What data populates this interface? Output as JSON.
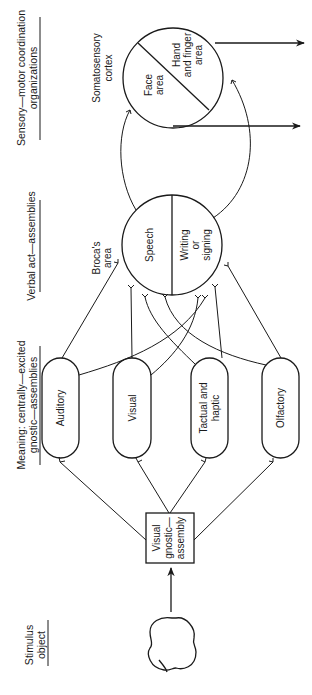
{
  "column_headers": {
    "stimulus": [
      "Stimulus",
      "object"
    ],
    "meaning": [
      "Meaning: centrally—excited",
      "gnostic—assemblies"
    ],
    "verbal": [
      "Verbal act—assemblies"
    ],
    "sensory_motor": [
      "Sensory—motor coordination",
      "organizations"
    ]
  },
  "stimulus": {
    "icon": "apple-icon"
  },
  "visual_gnostic_box": [
    "Visual",
    "gnostic—",
    "assembly"
  ],
  "gnostic_assemblies": [
    {
      "label": [
        "Auditory"
      ]
    },
    {
      "label": [
        "Visual"
      ]
    },
    {
      "label": [
        "Tactual and",
        "haptic"
      ]
    },
    {
      "label": [
        "Olfactory"
      ]
    }
  ],
  "brocas_area": {
    "caption": [
      "Broca's",
      "area"
    ],
    "halves": [
      {
        "label": [
          "Speech"
        ]
      },
      {
        "label": [
          "Writing",
          "or",
          "signing"
        ]
      }
    ]
  },
  "somatosensory_cortex": {
    "caption": [
      "Somatosensory",
      "cortex"
    ],
    "halves": [
      {
        "label": [
          "Face",
          "area"
        ]
      },
      {
        "label": [
          "Hand",
          "and finger",
          "area"
        ]
      }
    ]
  }
}
